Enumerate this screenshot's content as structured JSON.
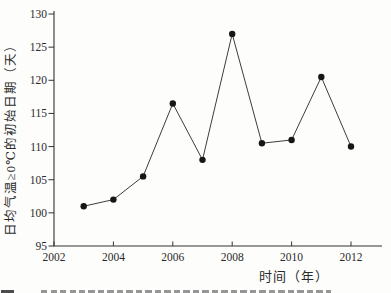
{
  "chart_data": {
    "type": "line",
    "title": "",
    "series_name": "日均气温≥0℃的初始日期",
    "x": [
      2003,
      2004,
      2005,
      2006,
      2007,
      2008,
      2009,
      2010,
      2011,
      2012
    ],
    "values": [
      101,
      102,
      105.5,
      116.5,
      108,
      127,
      110.5,
      111,
      120.5,
      110
    ],
    "xlabel": "时间（年）",
    "ylabel": "日均气温≥0℃的初始日期（天）",
    "xlim": [
      2002,
      2013
    ],
    "ylim": [
      95,
      130
    ],
    "x_ticks": [
      2002,
      2004,
      2006,
      2008,
      2010,
      2012
    ],
    "y_ticks": [
      95,
      100,
      105,
      110,
      115,
      120,
      125,
      130
    ],
    "grid": false,
    "legend": false,
    "marker": "filled-circle",
    "line_color": "#3d3d3d",
    "marker_color": "#161616",
    "axis_color": "#333333",
    "text_color": "#2a2a2a",
    "background": "#fdfdfc"
  }
}
